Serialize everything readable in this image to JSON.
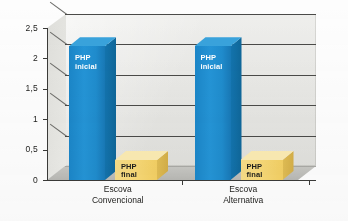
{
  "chart_data": {
    "type": "bar",
    "title": "",
    "subtitle": "",
    "xlabel": "",
    "ylabel": "",
    "categories": [
      "Escova Convencional",
      "Escova Alternativa"
    ],
    "category_lines": [
      [
        "Escova",
        "Convencional"
      ],
      [
        "Escova",
        "Alternativa"
      ]
    ],
    "series": [
      {
        "name": "PHP inicial",
        "values": [
          2.2,
          2.2
        ],
        "color": "#1f8ccd",
        "label_lines": [
          "PHP",
          "inicial"
        ]
      },
      {
        "name": "PHP final",
        "values": [
          0.33,
          0.33
        ],
        "color": "#f5d678",
        "label_lines": [
          "PHP",
          "final"
        ]
      }
    ],
    "ylim": [
      0,
      2.5
    ],
    "ytick_labels": [
      "2,5",
      "2",
      "1,5",
      "1",
      "0,5",
      "0"
    ],
    "ytick_values": [
      2.5,
      2,
      1.5,
      1,
      0.5,
      0
    ],
    "grid": true,
    "legend": "none",
    "style": "3d-column",
    "colors": {
      "backwall": "#e9e9e6",
      "floor": "#c0c0bc",
      "gridline": "#4a4a48",
      "axis": "#3a3a38",
      "series_blue": "#1f8ccd",
      "series_yellow": "#f5d678",
      "text": "#1d1d1b"
    }
  }
}
